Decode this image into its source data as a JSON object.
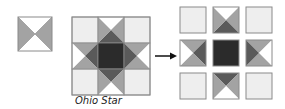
{
  "figure": {
    "caption": "Ohio Star",
    "colors": {
      "light": "#eeeeee",
      "white": "#ffffff",
      "mid": "#a3a3a3",
      "dark": "#5a5a5a",
      "darkest": "#2b2b2b",
      "stroke": "#8a8a8a"
    },
    "single_block": {
      "label": "hourglass quarter-square triangle unit"
    },
    "ohio_star_block": {
      "label": "assembled Ohio Star block",
      "grid": "3x3"
    },
    "arrow": {
      "label": "exploded into units"
    },
    "exploded_grid": {
      "cells": [
        {
          "row": 0,
          "col": 0,
          "type": "plain"
        },
        {
          "row": 0,
          "col": 1,
          "type": "qst",
          "top": "white",
          "right": "mid",
          "bottom": "dark",
          "left": "mid"
        },
        {
          "row": 0,
          "col": 2,
          "type": "plain"
        },
        {
          "row": 1,
          "col": 0,
          "type": "qst",
          "top": "mid",
          "right": "dark",
          "bottom": "mid",
          "left": "white"
        },
        {
          "row": 1,
          "col": 1,
          "type": "center"
        },
        {
          "row": 1,
          "col": 2,
          "type": "qst",
          "top": "mid",
          "right": "white",
          "bottom": "mid",
          "left": "dark"
        },
        {
          "row": 2,
          "col": 0,
          "type": "plain"
        },
        {
          "row": 2,
          "col": 1,
          "type": "qst",
          "top": "dark",
          "right": "mid",
          "bottom": "white",
          "left": "mid"
        },
        {
          "row": 2,
          "col": 2,
          "type": "plain"
        }
      ]
    }
  }
}
